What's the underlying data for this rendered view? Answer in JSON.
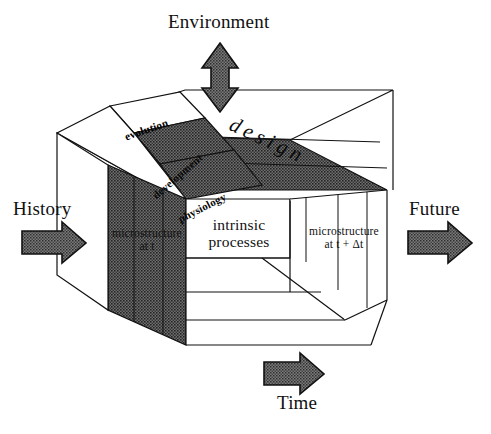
{
  "figure": {
    "background": "#ffffff",
    "ink": "#111111",
    "shade_dark": "#6d6d6d",
    "shade_darker": "#4a4a4a",
    "arrow_fill": "#6a6a6a"
  },
  "outer_labels": {
    "environment": "Environment",
    "history": "History",
    "future": "Future",
    "time": "Time"
  },
  "arrows": [
    {
      "name": "environment-arrow",
      "direction": "double-vertical",
      "label": "Environment"
    },
    {
      "name": "history-arrow",
      "direction": "right",
      "label": "History"
    },
    {
      "name": "future-arrow",
      "direction": "right",
      "label": "Future"
    },
    {
      "name": "time-arrow",
      "direction": "right",
      "label": "Time"
    }
  ],
  "cube": {
    "top_face": {
      "band_label": "design",
      "tiles": [
        {
          "name": "evolution-tile",
          "label": "evolution",
          "shade": "white"
        },
        {
          "name": "development-tile",
          "label": "development",
          "shade": "dark"
        },
        {
          "name": "physiology-tile",
          "label": "physiology",
          "shade": "dark"
        }
      ]
    },
    "left_face": {
      "label_line1": "microstructure",
      "label_line2": "at t",
      "shade": "dark"
    },
    "front_face": {
      "label_line1": "intrinsic",
      "label_line2": "processes",
      "shade": "white"
    },
    "right_face": {
      "label_line1": "microstructure",
      "label_line2": "at t + Δt",
      "shade": "white"
    }
  }
}
